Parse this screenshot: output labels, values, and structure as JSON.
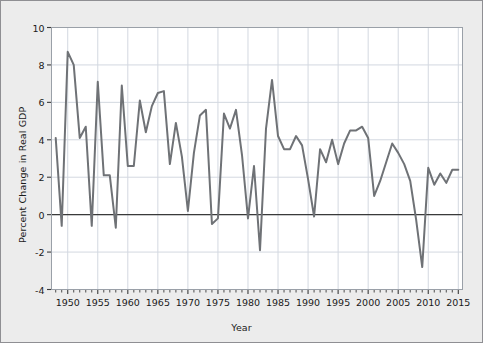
{
  "chart_data": {
    "type": "line",
    "title": "",
    "xlabel": "Year",
    "ylabel": "Percent Change in Real GDP",
    "xlim": [
      1947.3,
      2015.7
    ],
    "ylim": [
      -4,
      10
    ],
    "xticks_major": [
      1950,
      1955,
      1960,
      1965,
      1970,
      1975,
      1980,
      1985,
      1990,
      1995,
      2000,
      2005,
      2010,
      2015
    ],
    "xtick_labels": [
      "1950",
      "1955",
      "1960",
      "1965",
      "1970",
      "1975",
      "1980",
      "1985",
      "1990",
      "1995",
      "2000",
      "2005",
      "2010",
      "2015"
    ],
    "xtick_minor_step": 1,
    "yticks": [
      -4,
      -2,
      0,
      2,
      4,
      6,
      8,
      10
    ],
    "ytick_labels": [
      "-4",
      "-2",
      "0",
      "2",
      "4",
      "6",
      "8",
      "10"
    ],
    "grid": true,
    "grid_color": "#d3d8e0",
    "zero_line": true,
    "zero_line_color": "#3a3a3a",
    "line_color": "#6f7276",
    "line_width": 2.0,
    "plot_background": "#ffffff",
    "figure_background": "#ececec",
    "legend": null,
    "x": [
      1948,
      1949,
      1950,
      1951,
      1952,
      1953,
      1954,
      1955,
      1956,
      1957,
      1958,
      1959,
      1960,
      1961,
      1962,
      1963,
      1964,
      1965,
      1966,
      1967,
      1968,
      1969,
      1970,
      1971,
      1972,
      1973,
      1974,
      1975,
      1976,
      1977,
      1978,
      1979,
      1980,
      1981,
      1982,
      1983,
      1984,
      1985,
      1986,
      1987,
      1988,
      1989,
      1990,
      1991,
      1992,
      1993,
      1994,
      1995,
      1996,
      1997,
      1998,
      1999,
      2000,
      2001,
      2002,
      2003,
      2004,
      2005,
      2006,
      2007,
      2008,
      2009,
      2010,
      2011,
      2012,
      2013,
      2014,
      2015
    ],
    "y": [
      4.1,
      -0.6,
      8.7,
      8.0,
      4.1,
      4.7,
      -0.6,
      7.1,
      2.1,
      2.1,
      -0.7,
      6.9,
      2.6,
      2.6,
      6.1,
      4.4,
      5.8,
      6.5,
      6.6,
      2.7,
      4.9,
      3.1,
      0.2,
      3.3,
      5.3,
      5.6,
      -0.5,
      -0.2,
      5.4,
      4.6,
      5.6,
      3.2,
      -0.2,
      2.6,
      -1.9,
      4.6,
      7.2,
      4.2,
      3.5,
      3.5,
      4.2,
      3.7,
      1.9,
      -0.1,
      3.5,
      2.8,
      4.0,
      2.7,
      3.8,
      4.5,
      4.5,
      4.7,
      4.1,
      1.0,
      1.8,
      2.8,
      3.8,
      3.3,
      2.7,
      1.8,
      -0.3,
      -2.8,
      2.5,
      1.6,
      2.2,
      1.7,
      2.4,
      2.4
    ]
  }
}
